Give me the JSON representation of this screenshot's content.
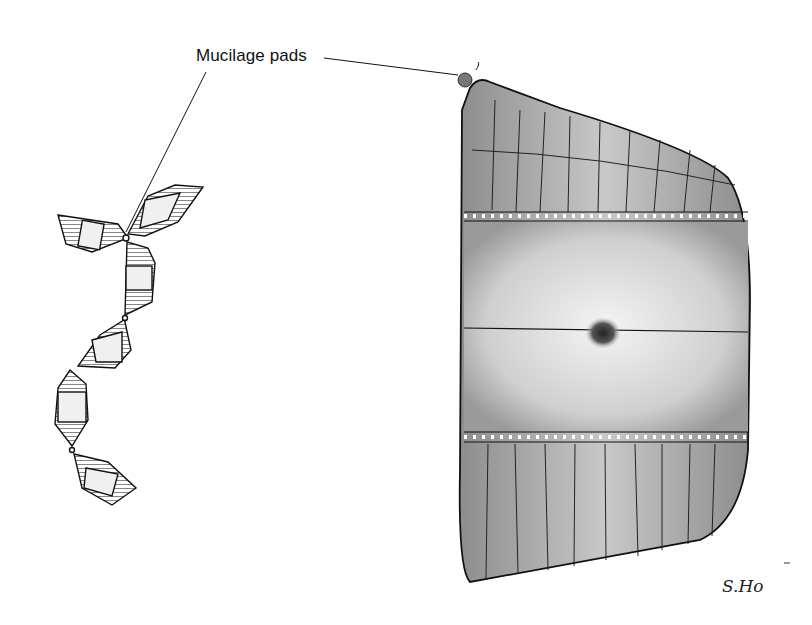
{
  "figure": {
    "annotation_label": "Mucilage pads",
    "signature": "S.Ho",
    "colors": {
      "ink": "#1a1a1a",
      "stipple_dark": "#8a8a8a",
      "stipple_light": "#d8d8d8",
      "background": "#ffffff"
    },
    "parts": {
      "chain": "zigzag-colony-chain",
      "cell": "single-frustule-girdle-view"
    }
  }
}
